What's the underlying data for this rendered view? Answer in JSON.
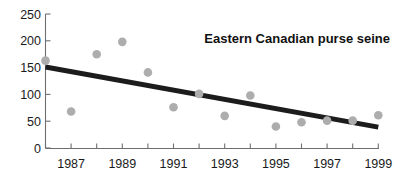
{
  "chart_data": {
    "type": "scatter",
    "title": "Eastern Canadian purse seine",
    "xlabel": "",
    "ylabel": "",
    "xlim": [
      1986,
      1999
    ],
    "ylim": [
      0,
      250
    ],
    "grid": false,
    "legend": null,
    "y_ticks": [
      0,
      50,
      100,
      150,
      200,
      250
    ],
    "y_tick_labels": [
      "0",
      "50",
      "100",
      "150",
      "200",
      "250"
    ],
    "x_ticks": [
      1986,
      1987,
      1988,
      1989,
      1990,
      1991,
      1992,
      1993,
      1994,
      1995,
      1996,
      1997,
      1998,
      1999
    ],
    "x_tick_labels": [
      "",
      "1987",
      "",
      "1989",
      "",
      "1991",
      "",
      "1993",
      "",
      "1995",
      "",
      "1997",
      "",
      "1999"
    ],
    "x": [
      1986,
      1987,
      1988,
      1989,
      1990,
      1991,
      1992,
      1993,
      1994,
      1995,
      1996,
      1997,
      1998,
      1999
    ],
    "values": [
      163,
      68,
      175,
      198,
      141,
      76,
      101,
      60,
      98,
      40,
      48,
      51,
      51,
      61
    ],
    "series": [
      {
        "name": "catch",
        "marker": "circle",
        "color": "#adadad",
        "x": [
          1986,
          1987,
          1988,
          1989,
          1990,
          1991,
          1992,
          1993,
          1994,
          1995,
          1996,
          1997,
          1998,
          1999
        ],
        "values": [
          163,
          68,
          175,
          198,
          141,
          76,
          101,
          60,
          98,
          40,
          48,
          51,
          51,
          61
        ]
      },
      {
        "name": "trend",
        "type": "line",
        "color": "#1c1c1c",
        "x": [
          1986,
          1999
        ],
        "values": [
          151,
          39
        ]
      }
    ],
    "annotations": []
  }
}
